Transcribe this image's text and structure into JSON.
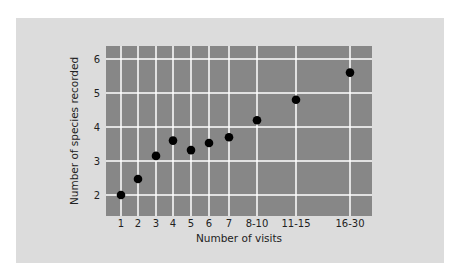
{
  "chart_data": {
    "type": "scatter",
    "title": "",
    "xlabel": "Number of visits",
    "ylabel": "Number of species recorded",
    "categories": [
      "1",
      "2",
      "3",
      "4",
      "5",
      "6",
      "7",
      "8-10",
      "11-15",
      "16-30"
    ],
    "values": [
      2.0,
      2.47,
      3.15,
      3.6,
      3.32,
      3.53,
      3.7,
      4.2,
      4.8,
      5.6
    ],
    "yticks": [
      2,
      3,
      4,
      5,
      6
    ],
    "ylim": [
      1.4,
      6.4
    ],
    "grid": true,
    "legend": null
  },
  "colors": {
    "page_background": "#ffffff",
    "card_background": "#dcdcdc",
    "plot_background": "#878787",
    "grid": "#ffffff",
    "marker": "#000000",
    "text": "#222222"
  }
}
